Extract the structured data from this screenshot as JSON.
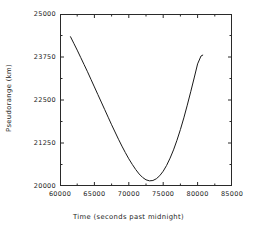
{
  "chart_data": {
    "type": "line",
    "title": "",
    "subtitle": "",
    "xlabel": "Time (seconds past midnight)",
    "ylabel": "Pseudorange (km)",
    "xlim": [
      60000,
      85000
    ],
    "ylim": [
      20000,
      25000
    ],
    "xticks": [
      60000,
      65000,
      70000,
      75000,
      80000,
      85000
    ],
    "yticks": [
      20000,
      21250,
      22500,
      23750,
      25000
    ],
    "xtick_labels": [
      "60000",
      "65000",
      "70000",
      "75000",
      "80000",
      "85000"
    ],
    "ytick_labels": [
      "20000",
      "21250",
      "22500",
      "23750",
      "25000"
    ],
    "x_minor_tick_count": 1,
    "y_minor_tick_count": 1,
    "grid": false,
    "legend": null,
    "line_color": "#1a1a1a",
    "line_width": 1,
    "series": [
      {
        "name": "pseudorange",
        "x": [
          61500,
          62000,
          62500,
          63000,
          63500,
          64000,
          64500,
          65000,
          65500,
          66000,
          66500,
          67000,
          67500,
          68000,
          68500,
          69000,
          69500,
          70000,
          70500,
          71000,
          71500,
          72000,
          72500,
          73000,
          73500,
          74000,
          74500,
          75000,
          75500,
          76000,
          76500,
          77000,
          77500,
          78000,
          78500,
          79000,
          79500,
          80000,
          80500,
          80800
        ],
        "y": [
          24350,
          24150,
          23950,
          23740,
          23530,
          23320,
          23100,
          22880,
          22660,
          22440,
          22220,
          22000,
          21780,
          21570,
          21360,
          21160,
          20970,
          20790,
          20630,
          20480,
          20350,
          20250,
          20180,
          20150,
          20160,
          20210,
          20300,
          20430,
          20600,
          20810,
          21050,
          21330,
          21640,
          21980,
          22350,
          22740,
          23140,
          23550,
          23780,
          23810
        ]
      }
    ],
    "annotations": []
  }
}
